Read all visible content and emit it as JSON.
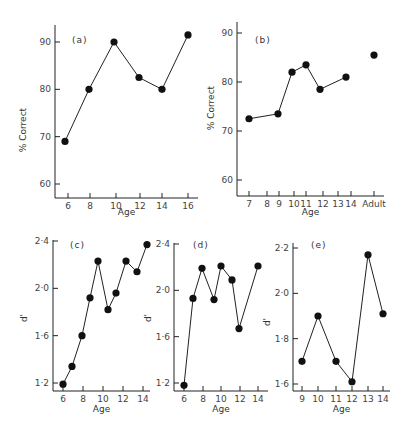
{
  "chart_data": [
    {
      "id": "a",
      "type": "line",
      "panel_label": "(a)",
      "xlabel": "Age",
      "ylabel": "% Correct",
      "x_ticks": [
        "6",
        "8",
        "10",
        "12",
        "14",
        "16"
      ],
      "y_ticks": [
        "60",
        "70",
        "80",
        "90"
      ],
      "ylim": [
        58,
        93
      ],
      "series": [
        {
          "name": "a",
          "x": [
            6,
            8,
            10,
            12,
            14,
            16
          ],
          "values": [
            69,
            80,
            90,
            82.5,
            80,
            91.5
          ],
          "connected": true
        }
      ]
    },
    {
      "id": "b",
      "type": "line",
      "panel_label": "(b)",
      "xlabel": "Age",
      "ylabel": "% Correct",
      "x_ticks": [
        "7",
        "8",
        "9",
        "10",
        "11",
        "12",
        "13",
        "14",
        "Adult"
      ],
      "y_ticks": [
        "60",
        "70",
        "80",
        "90"
      ],
      "ylim": [
        57,
        92
      ],
      "series": [
        {
          "name": "b-children",
          "x": [
            "7",
            "9",
            "10",
            "11",
            "12",
            "14"
          ],
          "values": [
            72.5,
            73.5,
            82,
            83.5,
            78.5,
            81
          ],
          "connected": true
        },
        {
          "name": "b-adult",
          "x": [
            "Adult"
          ],
          "values": [
            85.5
          ],
          "connected": false
        }
      ]
    },
    {
      "id": "c",
      "type": "line",
      "panel_label": "(c)",
      "xlabel": "Age",
      "ylabel": "d'",
      "x_ticks": [
        "6",
        "8",
        "10",
        "12",
        "14"
      ],
      "y_ticks": [
        "1·2",
        "1·6",
        "2·0",
        "2·4"
      ],
      "ylim": [
        1.15,
        2.45
      ],
      "series": [
        {
          "name": "c",
          "x": [
            6,
            7,
            8,
            9,
            10,
            11,
            12,
            13,
            14,
            15
          ],
          "values": [
            1.19,
            1.34,
            1.6,
            1.92,
            2.23,
            1.82,
            1.96,
            2.23,
            2.14,
            2.37
          ],
          "connected": true
        }
      ]
    },
    {
      "id": "d",
      "type": "line",
      "panel_label": "(d)",
      "xlabel": "Age",
      "ylabel": "d'",
      "x_ticks": [
        "6",
        "8",
        "10",
        "12",
        "14"
      ],
      "y_ticks": [
        "1·2",
        "1·6",
        "2·0",
        "2·4"
      ],
      "ylim": [
        1.15,
        2.45
      ],
      "series": [
        {
          "name": "d",
          "x": [
            6,
            7,
            8,
            9,
            10,
            11,
            12,
            14
          ],
          "values": [
            1.18,
            1.93,
            2.19,
            1.92,
            2.21,
            2.09,
            1.67,
            2.21
          ],
          "connected": true
        }
      ]
    },
    {
      "id": "e",
      "type": "line",
      "panel_label": "(e)",
      "xlabel": "Age",
      "ylabel": "d'",
      "x_ticks": [
        "9",
        "10",
        "11",
        "12",
        "13",
        "14"
      ],
      "y_ticks": [
        "1·6",
        "1·8",
        "2·0",
        "2·2"
      ],
      "ylim": [
        1.57,
        2.23
      ],
      "series": [
        {
          "name": "e",
          "x": [
            9,
            10,
            11,
            12,
            13,
            14
          ],
          "values": [
            1.7,
            1.9,
            1.7,
            1.61,
            2.17,
            1.91
          ],
          "connected": true
        }
      ]
    }
  ]
}
